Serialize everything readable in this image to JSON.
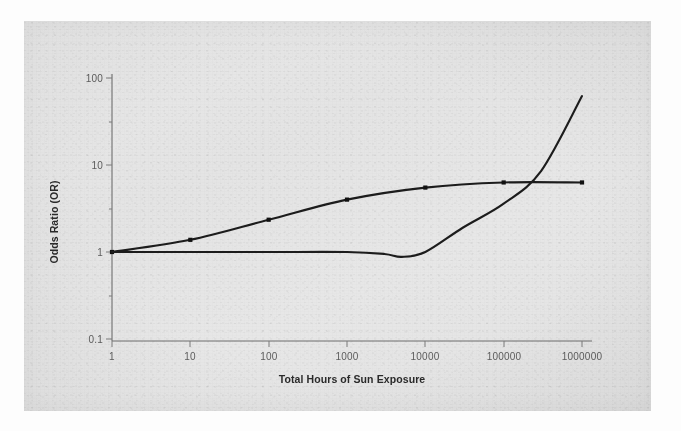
{
  "figure": {
    "background_color": "#e6e6e6",
    "page_color": "#fdfdfd",
    "line_color": "#1c1c1c",
    "axis_color": "#6f6f6f"
  },
  "chart_data": {
    "type": "line",
    "title": "",
    "xlabel": "Total Hours of Sun Exposure",
    "ylabel": "Odds Ratio (OR)",
    "xscale": "log",
    "yscale": "log",
    "xlim": [
      1,
      1000000
    ],
    "ylim": [
      0.1,
      100
    ],
    "grid": false,
    "legend": "none",
    "xticks": [
      1,
      10,
      100,
      1000,
      10000,
      100000,
      1000000
    ],
    "xticklabels": [
      "1",
      "10",
      "100",
      "1000",
      "10000",
      "100000",
      "1000000"
    ],
    "yticks": [
      0.1,
      1,
      10,
      100
    ],
    "yticklabels": [
      "0.1",
      "1",
      "10",
      "100"
    ],
    "series": [
      {
        "name": "saturating-curve",
        "marker": "square",
        "x": [
          1,
          10,
          100,
          1000,
          10000,
          100000,
          1000000
        ],
        "y": [
          1.0,
          1.38,
          2.35,
          4.0,
          5.5,
          6.3,
          6.3
        ]
      },
      {
        "name": "threshold-curve",
        "marker": "none",
        "x": [
          1,
          10,
          100,
          1000,
          3000,
          5000,
          10000,
          30000,
          100000,
          300000,
          1000000
        ],
        "y": [
          1.0,
          1.0,
          1.0,
          1.0,
          0.95,
          0.88,
          1.0,
          1.9,
          3.6,
          8.5,
          62.0
        ]
      }
    ]
  },
  "axis_titles": {
    "x": "Total Hours of Sun Exposure",
    "y": "Odds Ratio (OR)"
  }
}
